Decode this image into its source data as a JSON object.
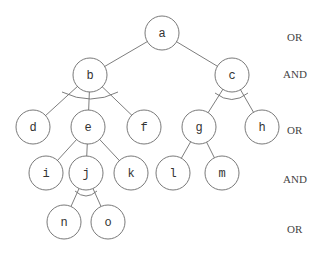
{
  "diagram": {
    "type": "and-or-tree",
    "nodes": [
      {
        "id": "a",
        "label": "a",
        "x": 162,
        "y": 33
      },
      {
        "id": "b",
        "label": "b",
        "x": 90,
        "y": 75
      },
      {
        "id": "c",
        "label": "c",
        "x": 232,
        "y": 75
      },
      {
        "id": "d",
        "label": "d",
        "x": 33,
        "y": 127
      },
      {
        "id": "e",
        "label": "e",
        "x": 88,
        "y": 127
      },
      {
        "id": "f",
        "label": "f",
        "x": 144,
        "y": 127
      },
      {
        "id": "g",
        "label": "g",
        "x": 199,
        "y": 127
      },
      {
        "id": "h",
        "label": "h",
        "x": 262,
        "y": 127
      },
      {
        "id": "i",
        "label": "i",
        "x": 46,
        "y": 173
      },
      {
        "id": "j",
        "label": "j",
        "x": 86,
        "y": 173
      },
      {
        "id": "k",
        "label": "k",
        "x": 131,
        "y": 173
      },
      {
        "id": "l",
        "label": "l",
        "x": 173,
        "y": 173
      },
      {
        "id": "m",
        "label": "m",
        "x": 222,
        "y": 173
      },
      {
        "id": "n",
        "label": "n",
        "x": 64,
        "y": 222
      },
      {
        "id": "o",
        "label": "o",
        "x": 108,
        "y": 222
      }
    ],
    "edges": [
      [
        "a",
        "b"
      ],
      [
        "a",
        "c"
      ],
      [
        "b",
        "d"
      ],
      [
        "b",
        "e"
      ],
      [
        "b",
        "f"
      ],
      [
        "c",
        "g"
      ],
      [
        "c",
        "h"
      ],
      [
        "e",
        "i"
      ],
      [
        "e",
        "j"
      ],
      [
        "e",
        "k"
      ],
      [
        "g",
        "l"
      ],
      [
        "g",
        "m"
      ],
      [
        "j",
        "n"
      ],
      [
        "j",
        "o"
      ]
    ],
    "and_arcs": [
      {
        "node": "b",
        "children": [
          "d",
          "e",
          "f"
        ]
      },
      {
        "node": "c",
        "children": [
          "g",
          "h"
        ]
      },
      {
        "node": "j",
        "children": [
          "n",
          "o"
        ]
      }
    ],
    "level_labels": [
      {
        "text": "OR",
        "y": 37
      },
      {
        "text": "AND",
        "y": 74
      },
      {
        "text": "OR",
        "y": 130
      },
      {
        "text": "AND",
        "y": 179
      },
      {
        "text": "OR",
        "y": 229
      }
    ]
  }
}
